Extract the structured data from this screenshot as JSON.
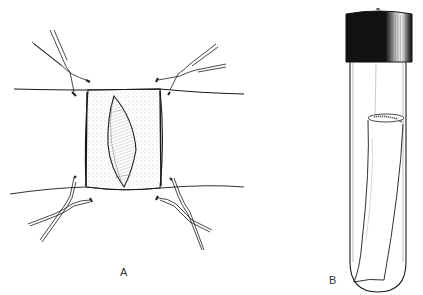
{
  "figure": {
    "panels": [
      {
        "label": "A",
        "description": "Surgical incision site held open with four hemostat clamps on stretched skin"
      },
      {
        "label": "B",
        "description": "Capped test tube containing excised tissue specimen"
      }
    ]
  },
  "colors": {
    "ink": "#1a1a1a",
    "stipple": "#8a8a8a",
    "cap": "#111111",
    "background": "#ffffff"
  }
}
